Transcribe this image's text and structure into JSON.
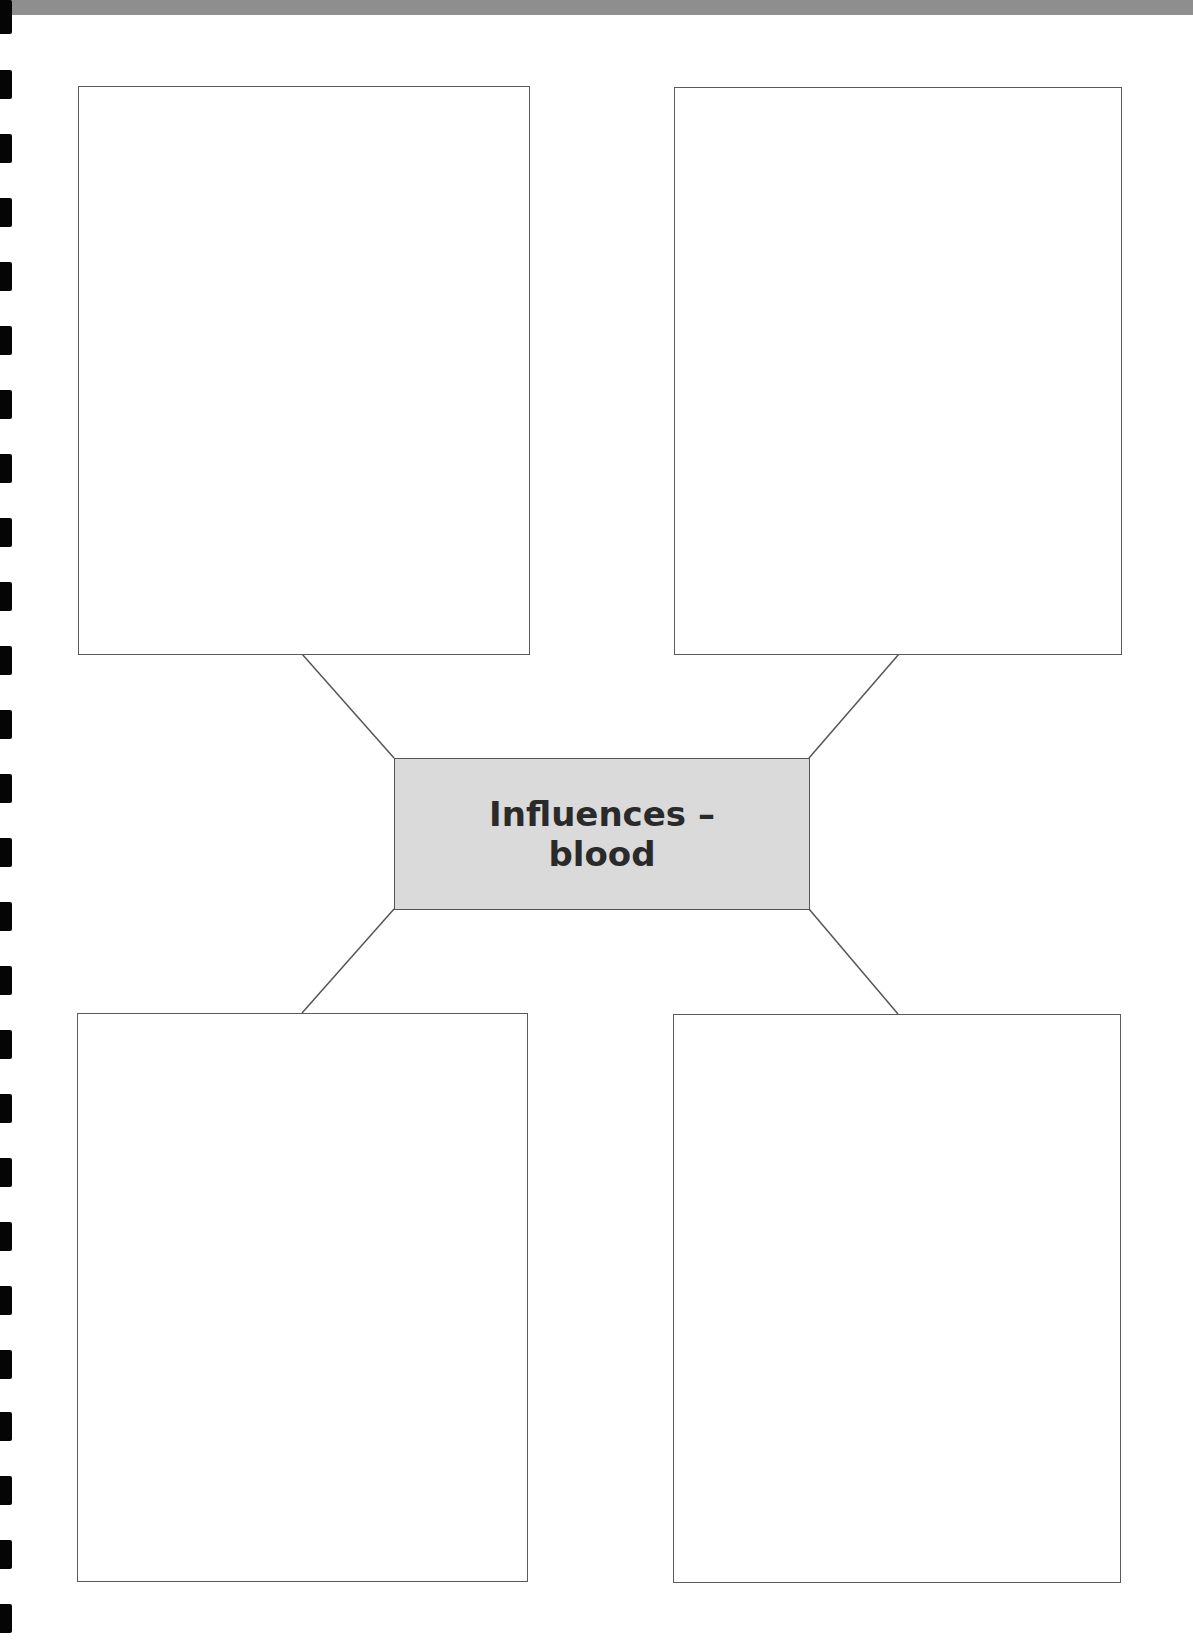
{
  "header": {
    "title": "",
    "title_note_visible": "clipped",
    "band_color": "#8e8e8e"
  },
  "diagram": {
    "type": "spider-diagram",
    "center": {
      "line1": "Influences –",
      "line2": "blood",
      "fill_color": "#dadada",
      "text_color": "#2a2a2a"
    },
    "boxes": [
      {
        "position": "top-left",
        "content": ""
      },
      {
        "position": "top-right",
        "content": ""
      },
      {
        "position": "bottom-left",
        "content": ""
      },
      {
        "position": "bottom-right",
        "content": ""
      }
    ],
    "line_color": "#555555"
  },
  "binding": {
    "mark_count": 26,
    "mark_color": "#050505"
  }
}
